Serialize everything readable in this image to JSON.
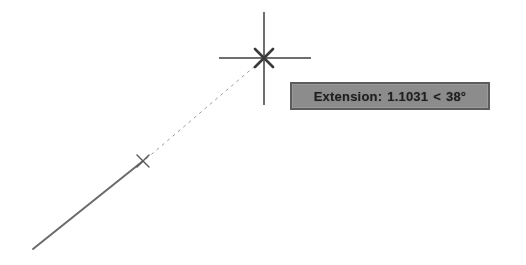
{
  "app": {
    "title": "CAD Drawing Area",
    "background_color": "#ffffff"
  },
  "tooltip": {
    "name": "extension-snap-tooltip",
    "full_text": "Extension: 1.1031 < 38°",
    "label": "Extension:",
    "distance": "1.1031",
    "separator": "<",
    "angle": "38°",
    "background_color": "#8c8c8c",
    "border_color": "#5c5c5c",
    "text_color": "#1f1f1f",
    "x": 290,
    "y": 82,
    "width": 200,
    "height": 28
  },
  "crosshair": {
    "name": "cursor-crosshair",
    "center_x": 264,
    "center_y": 58,
    "horizontal_start_x": 219,
    "horizontal_end_x": 311,
    "vertical_start_y": 12,
    "vertical_end_y": 105,
    "color": "#6e6e6e",
    "marker": "x-snap-marker",
    "marker_color": "#3a3a3a"
  },
  "solid_line": {
    "name": "existing-line-segment",
    "x1": 33,
    "y1": 249,
    "x2": 143,
    "y2": 161,
    "color": "#6a6a6a",
    "width": 2
  },
  "extension_line": {
    "name": "extension-tracking-line",
    "x1": 146,
    "y1": 159,
    "x2": 262,
    "y2": 60,
    "color": "#9a9a9a",
    "width": 1,
    "dash": "3,4"
  },
  "endpoint_marker": {
    "name": "endpoint-snap-marker",
    "x": 143,
    "y": 161,
    "size": 6,
    "color": "#5a5a5a"
  },
  "legend": {
    "description": "AutoCAD object snap extension tracking readout"
  }
}
